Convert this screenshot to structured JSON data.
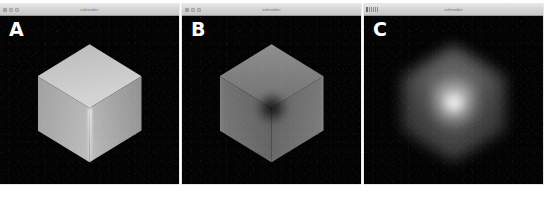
{
  "figure": {
    "caption": "",
    "background_color": "#ffffff"
  },
  "panels": [
    {
      "label": "A",
      "window": {
        "title": "volrender",
        "controls": "traffic-lights",
        "buttons": [
          "close",
          "minimize",
          "zoom"
        ]
      },
      "render": {
        "subject": "cube",
        "appearance": "sharp cube, bright diffuse faces, hard specular vertical highlight at front edge",
        "background_color": "#030303",
        "noise": "film grain"
      }
    },
    {
      "label": "B",
      "window": {
        "title": "volrender",
        "controls": "traffic-lights",
        "buttons": [
          "close",
          "minimize",
          "zoom"
        ]
      },
      "render": {
        "subject": "cube",
        "appearance": "same cube, dimmer faces with dark absorbing core at centre vertex",
        "background_color": "#030303",
        "noise": "film grain"
      }
    },
    {
      "label": "C",
      "window": {
        "title": "volrender",
        "controls": "tick-marks",
        "buttons": []
      },
      "render": {
        "subject": "cube",
        "appearance": "heavily blurred cube, diffuse glow with bright central point, no hard edges",
        "background_color": "#030303",
        "noise": "film grain"
      }
    }
  ],
  "colors": {
    "page_background": "#ffffff",
    "canvas_background": "#030303",
    "titlebar_top": "#e8e8e8",
    "titlebar_bottom": "#c9c9c9",
    "titlebar_border": "#9a9a9a",
    "label_color": "#ffffff",
    "title_text_color": "#6b6b6b"
  }
}
